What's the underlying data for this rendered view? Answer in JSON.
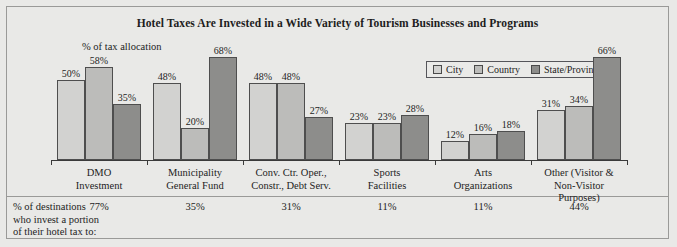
{
  "chart_data": {
    "type": "bar",
    "title": "Hotel Taxes Are Invested in a Wide Variety of Tourism Businesses and Programs",
    "ylabel": "% of tax allocation",
    "xlabel": "",
    "ylim": [
      0,
      70
    ],
    "grid": false,
    "legend_position": "top-right",
    "categories": [
      "DMO\nInvestment",
      "Municipality\nGeneral Fund",
      "Conv. Ctr. Oper.,\nConstr., Debt Serv.",
      "Sports\nFacilities",
      "Arts\nOrganizations",
      "Other (Visitor &\nNon-Visitor\nPurposes)"
    ],
    "series": [
      {
        "name": "City",
        "color": "#d2d2d0",
        "values": [
          50,
          48,
          48,
          23,
          12,
          31
        ]
      },
      {
        "name": "Country",
        "color": "#bcbcba",
        "values": [
          58,
          20,
          48,
          23,
          16,
          34
        ]
      },
      {
        "name": "State/Province",
        "color": "#8d8d8b",
        "values": [
          35,
          68,
          27,
          28,
          18,
          66
        ]
      }
    ],
    "value_labels": [
      [
        "50%",
        "58%",
        "35%"
      ],
      [
        "48%",
        "20%",
        "68%"
      ],
      [
        "48%",
        "48%",
        "27%"
      ],
      [
        "23%",
        "23%",
        "28%"
      ],
      [
        "12%",
        "16%",
        "18%"
      ],
      [
        "31%",
        "34%",
        "66%"
      ]
    ],
    "footer_caption_lines": [
      "% of destinations",
      "who invest a portion",
      "of their hotel tax to:"
    ],
    "footer_values": [
      "77%",
      "35%",
      "31%",
      "11%",
      "11%",
      "44%"
    ]
  },
  "categories_display": [
    [
      "DMO",
      "Investment"
    ],
    [
      "Municipality",
      "General Fund"
    ],
    [
      "Conv. Ctr. Oper.,",
      "Constr., Debt Serv."
    ],
    [
      "Sports",
      "Facilities"
    ],
    [
      "Arts",
      "Organizations"
    ],
    [
      "Other (Visitor &",
      "Non-Visitor",
      "Purposes)"
    ]
  ],
  "legend": {
    "items": [
      {
        "label": "City",
        "color": "#d2d2d0"
      },
      {
        "label": "Country",
        "color": "#bcbcba"
      },
      {
        "label": "State/Province",
        "color": "#8d8d8b"
      }
    ]
  },
  "colors": {
    "background": "#e9e9e7",
    "frame_border": "#9a9a98",
    "axis": "#3a3a3a",
    "bar_outline": "#4e4e4e",
    "text": "#1d1d1d"
  }
}
